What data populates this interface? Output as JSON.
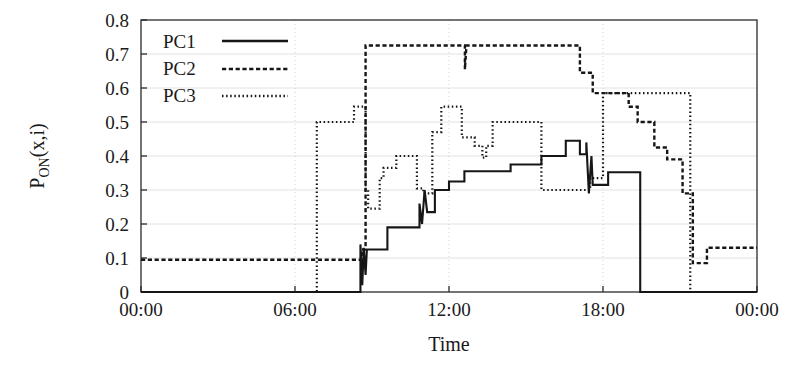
{
  "chart_data": {
    "type": "line",
    "title": "",
    "xlabel": "Time",
    "ylabel": "P_ON(x,i)",
    "ylabel_base": "P",
    "ylabel_subscript": "ON",
    "ylabel_arg": "(x,i)",
    "grid": true,
    "legend_position": "top-left inside",
    "xlim": [
      0,
      24
    ],
    "ylim": [
      0,
      0.8
    ],
    "xticks": [
      0,
      6,
      12,
      18,
      24
    ],
    "xtick_labels": [
      "00:00",
      "06:00",
      "12:00",
      "18:00",
      "00:00"
    ],
    "yticks": [
      0,
      0.1,
      0.2,
      0.3,
      0.4,
      0.5,
      0.6,
      0.7,
      0.8
    ],
    "ytick_labels": [
      "0",
      "0.1",
      "0.2",
      "0.3",
      "0.4",
      "0.5",
      "0.6",
      "0.7",
      "0.8"
    ],
    "series": [
      {
        "name": "PC1",
        "style": "solid",
        "color": "#161616",
        "points": [
          [
            0.0,
            0.0
          ],
          [
            8.55,
            0.0
          ],
          [
            8.55,
            0.14
          ],
          [
            8.62,
            0.02
          ],
          [
            8.68,
            0.13
          ],
          [
            8.75,
            0.05
          ],
          [
            8.8,
            0.125
          ],
          [
            8.85,
            0.125
          ],
          [
            9.6,
            0.125
          ],
          [
            9.6,
            0.19
          ],
          [
            10.85,
            0.19
          ],
          [
            10.85,
            0.26
          ],
          [
            10.95,
            0.2
          ],
          [
            11.05,
            0.3
          ],
          [
            11.15,
            0.235
          ],
          [
            11.25,
            0.235
          ],
          [
            11.45,
            0.235
          ],
          [
            11.45,
            0.3
          ],
          [
            12.0,
            0.3
          ],
          [
            12.0,
            0.325
          ],
          [
            12.6,
            0.325
          ],
          [
            12.6,
            0.355
          ],
          [
            14.4,
            0.355
          ],
          [
            14.4,
            0.375
          ],
          [
            15.6,
            0.375
          ],
          [
            15.6,
            0.4
          ],
          [
            16.55,
            0.4
          ],
          [
            16.55,
            0.445
          ],
          [
            17.1,
            0.445
          ],
          [
            17.1,
            0.405
          ],
          [
            17.35,
            0.405
          ],
          [
            17.35,
            0.44
          ],
          [
            17.45,
            0.29
          ],
          [
            17.55,
            0.4
          ],
          [
            17.6,
            0.315
          ],
          [
            17.65,
            0.315
          ],
          [
            18.2,
            0.315
          ],
          [
            18.2,
            0.352
          ],
          [
            19.45,
            0.352
          ],
          [
            19.45,
            0.0
          ],
          [
            24.0,
            0.0
          ]
        ]
      },
      {
        "name": "PC2",
        "style": "dashed",
        "color": "#161616",
        "points": [
          [
            0.0,
            0.095
          ],
          [
            8.6,
            0.095
          ],
          [
            8.6,
            0.125
          ],
          [
            8.75,
            0.125
          ],
          [
            8.75,
            0.725
          ],
          [
            12.62,
            0.725
          ],
          [
            12.62,
            0.655
          ],
          [
            12.68,
            0.725
          ],
          [
            17.1,
            0.725
          ],
          [
            17.1,
            0.645
          ],
          [
            17.6,
            0.645
          ],
          [
            17.6,
            0.585
          ],
          [
            19.0,
            0.585
          ],
          [
            19.0,
            0.545
          ],
          [
            19.35,
            0.545
          ],
          [
            19.35,
            0.5
          ],
          [
            20.0,
            0.5
          ],
          [
            20.0,
            0.425
          ],
          [
            20.5,
            0.425
          ],
          [
            20.5,
            0.39
          ],
          [
            21.1,
            0.39
          ],
          [
            21.1,
            0.29
          ],
          [
            21.5,
            0.29
          ],
          [
            21.5,
            0.085
          ],
          [
            22.05,
            0.085
          ],
          [
            22.05,
            0.13
          ],
          [
            24.0,
            0.13
          ]
        ]
      },
      {
        "name": "PC3",
        "style": "dotted",
        "color": "#161616",
        "points": [
          [
            0.0,
            0.0
          ],
          [
            6.85,
            0.0
          ],
          [
            6.85,
            0.5
          ],
          [
            8.3,
            0.5
          ],
          [
            8.3,
            0.545
          ],
          [
            8.75,
            0.545
          ],
          [
            8.75,
            0.3
          ],
          [
            8.85,
            0.3
          ],
          [
            8.85,
            0.245
          ],
          [
            9.3,
            0.245
          ],
          [
            9.3,
            0.335
          ],
          [
            9.45,
            0.335
          ],
          [
            9.45,
            0.365
          ],
          [
            9.95,
            0.365
          ],
          [
            9.95,
            0.4
          ],
          [
            10.75,
            0.4
          ],
          [
            10.75,
            0.305
          ],
          [
            11.0,
            0.305
          ],
          [
            11.0,
            0.29
          ],
          [
            11.35,
            0.29
          ],
          [
            11.35,
            0.47
          ],
          [
            11.7,
            0.47
          ],
          [
            11.7,
            0.545
          ],
          [
            12.5,
            0.545
          ],
          [
            12.5,
            0.455
          ],
          [
            13.0,
            0.455
          ],
          [
            13.0,
            0.43
          ],
          [
            13.3,
            0.43
          ],
          [
            13.3,
            0.395
          ],
          [
            13.45,
            0.395
          ],
          [
            13.45,
            0.43
          ],
          [
            13.7,
            0.43
          ],
          [
            13.7,
            0.5
          ],
          [
            15.6,
            0.5
          ],
          [
            15.6,
            0.3
          ],
          [
            17.5,
            0.3
          ],
          [
            17.5,
            0.335
          ],
          [
            18.0,
            0.335
          ],
          [
            18.0,
            0.585
          ],
          [
            21.4,
            0.585
          ],
          [
            21.4,
            0.0
          ],
          [
            24.0,
            0.0
          ]
        ]
      }
    ]
  },
  "legend": {
    "entries": [
      {
        "label": "PC1"
      },
      {
        "label": "PC2"
      },
      {
        "label": "PC3"
      }
    ]
  },
  "colors": {
    "ink": "#161616",
    "grid_horizontal": "#e2e2e2",
    "grid_vertical": "#cfcfcf",
    "frame": "#2a2a2a",
    "background": "#ffffff"
  }
}
